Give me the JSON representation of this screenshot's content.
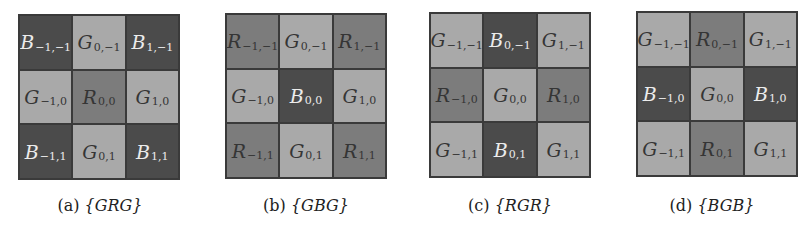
{
  "figure": {
    "colors": {
      "B": "#4b4b4b",
      "R": "#7c7c7c",
      "G": "#a9a9a9",
      "text_on_dark": "#ececec",
      "text_on_light": "#353535"
    },
    "panels": [
      {
        "label": "(a)",
        "pattern": "{GRG}",
        "cells": [
          {
            "ch": "B",
            "sub": "−1,−1"
          },
          {
            "ch": "G",
            "sub": "0,−1"
          },
          {
            "ch": "B",
            "sub": "1,−1"
          },
          {
            "ch": "G",
            "sub": "−1,0"
          },
          {
            "ch": "R",
            "sub": "0,0"
          },
          {
            "ch": "G",
            "sub": "1,0"
          },
          {
            "ch": "B",
            "sub": "−1,1"
          },
          {
            "ch": "G",
            "sub": "0,1"
          },
          {
            "ch": "B",
            "sub": "1,1"
          }
        ]
      },
      {
        "label": "(b)",
        "pattern": "{GBG}",
        "cells": [
          {
            "ch": "R",
            "sub": "−1,−1"
          },
          {
            "ch": "G",
            "sub": "0,−1"
          },
          {
            "ch": "R",
            "sub": "1,−1"
          },
          {
            "ch": "G",
            "sub": "−1,0"
          },
          {
            "ch": "B",
            "sub": "0,0"
          },
          {
            "ch": "G",
            "sub": "1,0"
          },
          {
            "ch": "R",
            "sub": "−1,1"
          },
          {
            "ch": "G",
            "sub": "0,1"
          },
          {
            "ch": "R",
            "sub": "1,1"
          }
        ]
      },
      {
        "label": "(c)",
        "pattern": "{RGR}",
        "cells": [
          {
            "ch": "G",
            "sub": "−1,−1"
          },
          {
            "ch": "B",
            "sub": "0,−1"
          },
          {
            "ch": "G",
            "sub": "1,−1"
          },
          {
            "ch": "R",
            "sub": "−1,0"
          },
          {
            "ch": "G",
            "sub": "0,0"
          },
          {
            "ch": "R",
            "sub": "1,0"
          },
          {
            "ch": "G",
            "sub": "−1,1"
          },
          {
            "ch": "B",
            "sub": "0,1"
          },
          {
            "ch": "G",
            "sub": "1,1"
          }
        ]
      },
      {
        "label": "(d)",
        "pattern": "{BGB}",
        "cells": [
          {
            "ch": "G",
            "sub": "−1,−1"
          },
          {
            "ch": "R",
            "sub": "0,−1"
          },
          {
            "ch": "G",
            "sub": "1,−1"
          },
          {
            "ch": "B",
            "sub": "−1,0"
          },
          {
            "ch": "G",
            "sub": "0,0"
          },
          {
            "ch": "B",
            "sub": "1,0"
          },
          {
            "ch": "G",
            "sub": "−1,1"
          },
          {
            "ch": "R",
            "sub": "0,1"
          },
          {
            "ch": "G",
            "sub": "1,1"
          }
        ]
      }
    ]
  }
}
